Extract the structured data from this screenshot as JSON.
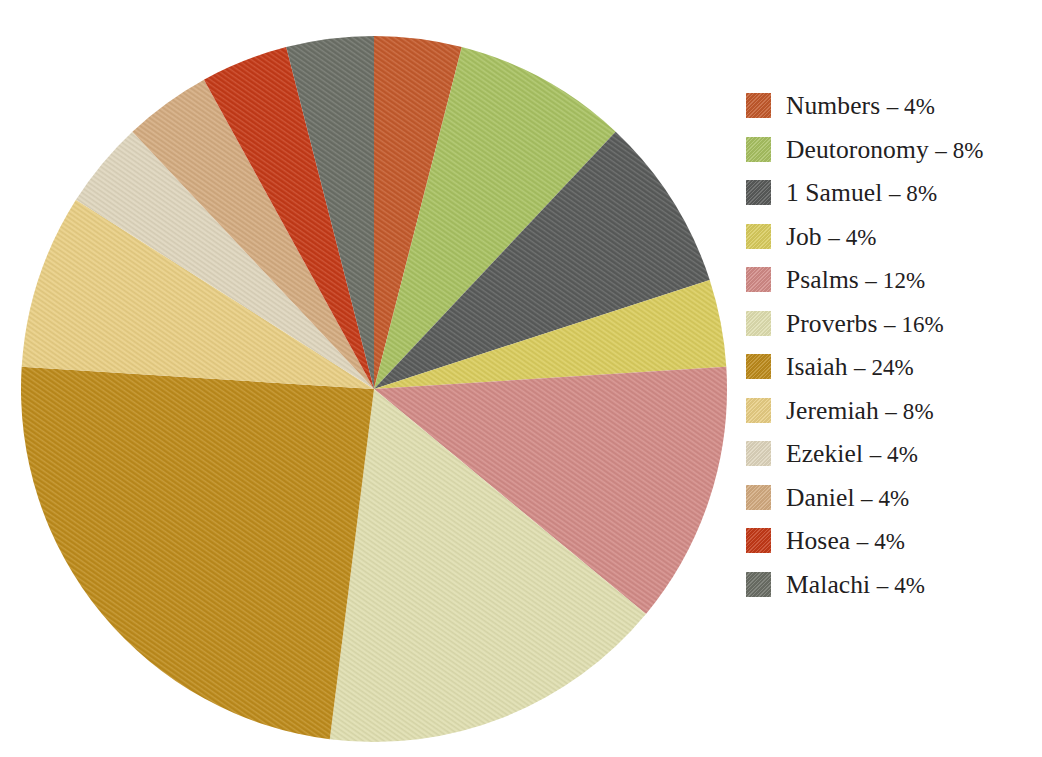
{
  "chart_data": {
    "type": "pie",
    "title": "",
    "subtitle": "",
    "xlabel": "",
    "ylabel": "",
    "legend_position": "right",
    "grid": false,
    "units": "%",
    "start_angle_deg": 0,
    "direction": "clockwise",
    "total": 100,
    "categories": [
      "Numbers",
      "Deutoronomy",
      "1 Samuel",
      "Job",
      "Psalms",
      "Proverbs",
      "Isaiah",
      "Jeremiah",
      "Ezekiel",
      "Daniel",
      "Hosea",
      "Malachi"
    ],
    "values": [
      4,
      8,
      8,
      4,
      12,
      16,
      24,
      8,
      4,
      4,
      4,
      4
    ],
    "colors": [
      "#c35a2c",
      "#a8c162",
      "#595b5a",
      "#d9cc5e",
      "#d28b87",
      "#dfdeb0",
      "#bd8b1c",
      "#e8ce84",
      "#ded5bd",
      "#d3ab80",
      "#c43a18",
      "#6b6f66"
    ],
    "slices": [
      {
        "label": "Numbers",
        "value": 4,
        "display": "Numbers – 4%",
        "color": "#c35a2c"
      },
      {
        "label": "Deutoronomy",
        "value": 8,
        "display": "Deutoronomy – 8%",
        "color": "#a8c162"
      },
      {
        "label": "1 Samuel",
        "value": 8,
        "display": "1 Samuel – 8%",
        "color": "#595b5a"
      },
      {
        "label": "Job",
        "value": 4,
        "display": "Job – 4%",
        "color": "#d9cc5e"
      },
      {
        "label": "Psalms",
        "value": 12,
        "display": "Psalms – 12%",
        "color": "#d28b87"
      },
      {
        "label": "Proverbs",
        "value": 16,
        "display": "Proverbs – 16%",
        "color": "#dfdeb0"
      },
      {
        "label": "Isaiah",
        "value": 24,
        "display": "Isaiah – 24%",
        "color": "#bd8b1c"
      },
      {
        "label": "Jeremiah",
        "value": 8,
        "display": "Jeremiah – 8%",
        "color": "#e8ce84"
      },
      {
        "label": "Ezekiel",
        "value": 4,
        "display": "Ezekiel – 4%",
        "color": "#ded5bd"
      },
      {
        "label": "Daniel",
        "value": 4,
        "display": "Daniel – 4%",
        "color": "#d3ab80"
      },
      {
        "label": "Hosea",
        "value": 4,
        "display": "Hosea – 4%",
        "color": "#c43a18"
      },
      {
        "label": "Malachi",
        "value": 4,
        "display": "Malachi – 4%",
        "color": "#6b6f66"
      }
    ]
  },
  "legend": {
    "entries": [
      {
        "name": "Numbers",
        "percent": "4%",
        "text": "Numbers – 4%",
        "swatch": "#c35a2c"
      },
      {
        "name": "Deutoronomy",
        "percent": "8%",
        "text": "Deutoronomy – 8%",
        "swatch": "#a8c162"
      },
      {
        "name": "1 Samuel",
        "percent": "8%",
        "text": "1 Samuel – 8%",
        "swatch": "#595b5a"
      },
      {
        "name": "Job",
        "percent": "4%",
        "text": "Job – 4%",
        "swatch": "#d9cc5e"
      },
      {
        "name": "Psalms",
        "percent": "12%",
        "text": "Psalms – 12%",
        "swatch": "#d28b87"
      },
      {
        "name": "Proverbs",
        "percent": "16%",
        "text": "Proverbs – 16%",
        "swatch": "#dfdeb0"
      },
      {
        "name": "Isaiah",
        "percent": "24%",
        "text": "Isaiah – 24%",
        "swatch": "#bd8b1c"
      },
      {
        "name": "Jeremiah",
        "percent": "8%",
        "text": "Jeremiah – 8%",
        "swatch": "#e8ce84"
      },
      {
        "name": "Ezekiel",
        "percent": "4%",
        "text": "Ezekiel – 4%",
        "swatch": "#ded5bd"
      },
      {
        "name": "Daniel",
        "percent": "4%",
        "text": "Daniel – 4%",
        "swatch": "#d3ab80"
      },
      {
        "name": "Hosea",
        "percent": "4%",
        "text": "Hosea – 4%",
        "swatch": "#c43a18"
      },
      {
        "name": "Malachi",
        "percent": "4%",
        "text": "Malachi – 4%",
        "swatch": "#6b6f66"
      }
    ]
  },
  "geometry": {
    "center_x": 374,
    "center_y": 389,
    "radius": 353
  }
}
